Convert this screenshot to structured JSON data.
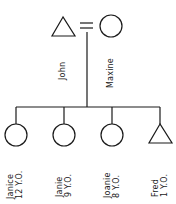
{
  "diagram": {
    "type": "genogram",
    "colors": {
      "stroke": "#1a1a1a",
      "background": "#ffffff"
    },
    "parents": {
      "father": {
        "name": "John",
        "symbol": "triangle"
      },
      "mother": {
        "name": "Maxine",
        "symbol": "circle"
      },
      "union_symbol": "="
    },
    "children": [
      {
        "name": "Janice",
        "age": "12 Y.O.",
        "symbol": "circle"
      },
      {
        "name": "Janie",
        "age": "9 Y.O.",
        "symbol": "circle"
      },
      {
        "name": "Joanie",
        "age": "8 Y.O.",
        "symbol": "circle"
      },
      {
        "name": "Fred",
        "age": "1 Y.O.",
        "symbol": "triangle"
      }
    ]
  }
}
